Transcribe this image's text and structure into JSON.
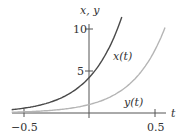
{
  "chart_data": {
    "type": "line",
    "title": "",
    "xlabel": "t",
    "ylabel": "x, y",
    "xlim": [
      -0.59,
      0.6
    ],
    "ylim": [
      0,
      10.5
    ],
    "x_ticks": [
      {
        "value": -0.5,
        "label": "−0.5"
      },
      {
        "value": 0.5,
        "label": "0.5"
      }
    ],
    "y_ticks": [
      {
        "value": 5,
        "label": "5"
      },
      {
        "value": 10,
        "label": "10"
      }
    ],
    "grid": false,
    "legend": "inline labels",
    "series": [
      {
        "name": "x(t)",
        "color": "#4a4a4a",
        "x": [
          -0.6,
          -0.5,
          -0.4,
          -0.3,
          -0.2,
          -0.1,
          0,
          0.1,
          0.2,
          0.25
        ],
        "values": [
          0.38,
          0.57,
          0.85,
          1.27,
          1.89,
          2.82,
          4.2,
          6.27,
          9.35,
          11.4
        ]
      },
      {
        "name": "y(t)",
        "color": "#b5b5b5",
        "x": [
          -0.6,
          -0.5,
          -0.4,
          -0.3,
          -0.2,
          -0.1,
          0,
          0.1,
          0.2,
          0.3,
          0.4,
          0.5,
          0.58
        ],
        "values": [
          0.09,
          0.14,
          0.2,
          0.3,
          0.45,
          0.67,
          1.0,
          1.49,
          2.23,
          3.32,
          4.95,
          7.39,
          10.2
        ]
      }
    ]
  },
  "labels": {
    "axis_y": "x, y",
    "axis_x": "t",
    "tick_10": "10",
    "tick_5": "5",
    "tick_neg05": "−0.5",
    "tick_05": "0.5",
    "series_x": "x(t)",
    "series_y": "y(t)"
  }
}
